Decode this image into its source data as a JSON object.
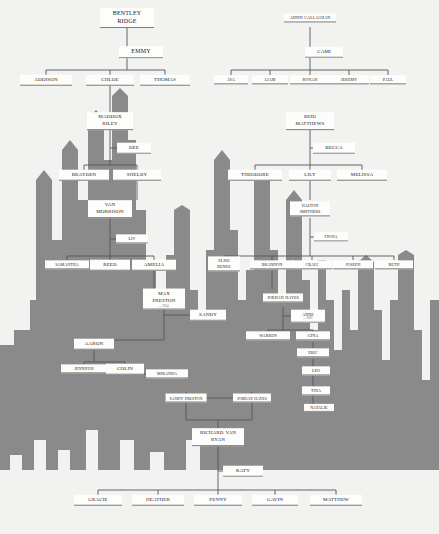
{
  "meta": {
    "background_color": "#f2f2f0",
    "skyline_color": "#8a8a8a",
    "card_color": "#fdfdfb",
    "line_color": "#55555a",
    "text_color": "#1b1b1b"
  },
  "nodes": [
    {
      "id": "bentley-ridge",
      "label": "Bentley Ridge",
      "x": 127,
      "y": 18,
      "size": "s12",
      "two": true,
      "w": 54
    },
    {
      "id": "emmy",
      "label": "Emmy",
      "x": 141,
      "y": 52,
      "size": "s12",
      "two": false,
      "w": 44,
      "spouse": true
    },
    {
      "id": "addison",
      "label": "Addison",
      "x": 46,
      "y": 80,
      "size": "s10",
      "two": false,
      "w": 52
    },
    {
      "id": "chloe",
      "label": "Chloe",
      "x": 110,
      "y": 80,
      "size": "s10",
      "two": false,
      "w": 48
    },
    {
      "id": "thomas",
      "label": "Thomas",
      "x": 165,
      "y": 80,
      "size": "s10",
      "two": false,
      "w": 50
    },
    {
      "id": "aiden-callaghan",
      "label": "Aiden Callaghan",
      "x": 310,
      "y": 18,
      "size": "s8",
      "two": true,
      "w": 52
    },
    {
      "id": "cami",
      "label": "Cami",
      "x": 324,
      "y": 52,
      "size": "s10",
      "two": false,
      "w": 38,
      "spouse": true
    },
    {
      "id": "ava",
      "label": "Ava",
      "x": 231,
      "y": 80,
      "size": "s8",
      "two": false,
      "w": 34
    },
    {
      "id": "liam",
      "label": "Liam",
      "x": 270,
      "y": 80,
      "size": "s8",
      "two": false,
      "w": 36
    },
    {
      "id": "ronan",
      "label": "Ronan",
      "x": 310,
      "y": 80,
      "size": "s8",
      "two": false,
      "w": 40
    },
    {
      "id": "jeremy",
      "label": "Jeremy",
      "x": 349,
      "y": 80,
      "size": "s8",
      "two": false,
      "w": 40
    },
    {
      "id": "paul",
      "label": "Paul",
      "x": 388,
      "y": 80,
      "size": "s8",
      "two": false,
      "w": 36
    },
    {
      "id": "maddox-riley",
      "label": "Maddox Riley",
      "x": 110,
      "y": 121,
      "size": "s10",
      "two": true,
      "w": 46
    },
    {
      "id": "dee",
      "label": "Dee",
      "x": 134,
      "y": 148,
      "size": "s10",
      "two": false,
      "w": 34,
      "spouse": true
    },
    {
      "id": "brayden",
      "label": "Brayden",
      "x": 84,
      "y": 175,
      "size": "s10",
      "two": false,
      "w": 50
    },
    {
      "id": "shelby",
      "label": "Shelby",
      "x": 137,
      "y": 175,
      "size": "s10",
      "two": false,
      "w": 48
    },
    {
      "id": "van-morrison",
      "label": "Van Morrison",
      "x": 110,
      "y": 209,
      "size": "s10",
      "two": true,
      "w": 44
    },
    {
      "id": "liv",
      "label": "Liv",
      "x": 132,
      "y": 239,
      "size": "s8",
      "two": false,
      "w": 32,
      "spouse": true
    },
    {
      "id": "samantha",
      "label": "Samantha",
      "x": 67,
      "y": 265,
      "size": "s8",
      "two": false,
      "w": 44
    },
    {
      "id": "reed",
      "label": "Reed",
      "x": 110,
      "y": 265,
      "size": "s10",
      "two": false,
      "w": 40
    },
    {
      "id": "amelia",
      "label": "Amelia",
      "x": 154,
      "y": 265,
      "size": "s10",
      "two": false,
      "w": 44
    },
    {
      "id": "max-preston",
      "label": "Max Preston",
      "x": 164,
      "y": 299,
      "size": "s10",
      "two": true,
      "w": 42,
      "sub": "b. 1954"
    },
    {
      "id": "sandy",
      "label": "Sandy",
      "x": 208,
      "y": 315,
      "size": "s10",
      "two": false,
      "w": 36,
      "spouse": true
    },
    {
      "id": "aaron",
      "label": "Aaron",
      "x": 94,
      "y": 344,
      "size": "s10",
      "two": false,
      "w": 40
    },
    {
      "id": "jennifer",
      "label": "Jennifer",
      "x": 84,
      "y": 369,
      "size": "s8",
      "two": false,
      "w": 46
    },
    {
      "id": "colin",
      "label": "Colin",
      "x": 125,
      "y": 369,
      "size": "s10",
      "two": false,
      "w": 38
    },
    {
      "id": "miranda",
      "label": "Miranda",
      "x": 167,
      "y": 374,
      "size": "s8",
      "two": false,
      "w": 42,
      "spouse": true
    },
    {
      "id": "reid-matthews",
      "label": "Reid Matthews",
      "x": 310,
      "y": 121,
      "size": "s10",
      "two": true,
      "w": 48
    },
    {
      "id": "becca",
      "label": "Becca",
      "x": 334,
      "y": 148,
      "size": "s10",
      "two": false,
      "w": 42,
      "spouse": true
    },
    {
      "id": "theodore",
      "label": "Theodore",
      "x": 255,
      "y": 175,
      "size": "s10",
      "two": false,
      "w": 54
    },
    {
      "id": "lily",
      "label": "Lily",
      "x": 310,
      "y": 175,
      "size": "s10",
      "two": false,
      "w": 42
    },
    {
      "id": "melissa",
      "label": "Melissa",
      "x": 362,
      "y": 175,
      "size": "s10",
      "two": false,
      "w": 50
    },
    {
      "id": "halton-smithers",
      "label": "Halton Smithers",
      "x": 310,
      "y": 209,
      "size": "s8",
      "two": true,
      "w": 40
    },
    {
      "id": "fiona",
      "label": "Fiona",
      "x": 331,
      "y": 237,
      "size": "s8",
      "two": false,
      "w": 34,
      "spouse": true
    },
    {
      "id": "elise-renee",
      "label": "Elise Renee",
      "x": 224,
      "y": 264,
      "size": "s8",
      "two": true,
      "w": 32
    },
    {
      "id": "brandon",
      "label": "Brandon",
      "x": 272,
      "y": 265,
      "size": "s8",
      "two": false,
      "w": 44
    },
    {
      "id": "craig",
      "label": "Craig",
      "x": 312,
      "y": 265,
      "size": "s8",
      "two": false,
      "w": 40
    },
    {
      "id": "joseph",
      "label": "Joseph",
      "x": 353,
      "y": 265,
      "size": "s8",
      "two": false,
      "w": 40
    },
    {
      "id": "beth",
      "label": "Beth",
      "x": 394,
      "y": 265,
      "size": "s8",
      "two": false,
      "w": 38
    },
    {
      "id": "jordan-hayes-2",
      "label": "Jordan Hayes",
      "x": 283,
      "y": 298,
      "size": "s8",
      "two": true,
      "w": 40
    },
    {
      "id": "anne",
      "label": "Anne",
      "x": 308,
      "y": 316,
      "size": "s8",
      "two": false,
      "w": 34,
      "spouse": true,
      "sub": "b. 1961"
    },
    {
      "id": "warren",
      "label": "Warren",
      "x": 268,
      "y": 336,
      "size": "s8",
      "two": false,
      "w": 44
    },
    {
      "id": "gina",
      "label": "Gina",
      "x": 313,
      "y": 336,
      "size": "s8",
      "two": false,
      "w": 34
    },
    {
      "id": "eric",
      "label": "Eric",
      "x": 313,
      "y": 353,
      "size": "s8",
      "two": false,
      "w": 32
    },
    {
      "id": "leo",
      "label": "Leo",
      "x": 316,
      "y": 371,
      "size": "s8",
      "two": false,
      "w": 28,
      "spouse": true
    },
    {
      "id": "tina",
      "label": "Tina",
      "x": 316,
      "y": 391,
      "size": "s8",
      "two": false,
      "w": 28,
      "spouse": true
    },
    {
      "id": "natalie",
      "label": "Natalie",
      "x": 319,
      "y": 408,
      "size": "s6",
      "two": false,
      "w": 30,
      "spouse": true
    },
    {
      "id": "richard-van-ryan",
      "label": "Richard Van Ryan",
      "x": 218,
      "y": 437,
      "size": "s10",
      "two": true,
      "w": 52
    },
    {
      "id": "katy",
      "label": "Katy",
      "x": 243,
      "y": 471,
      "size": "s10",
      "two": false,
      "w": 40,
      "spouse": true
    },
    {
      "id": "gracie",
      "label": "Gracie",
      "x": 98,
      "y": 500,
      "size": "s10",
      "two": false,
      "w": 48
    },
    {
      "id": "heather",
      "label": "Heather",
      "x": 158,
      "y": 500,
      "size": "s10",
      "two": false,
      "w": 52
    },
    {
      "id": "penny",
      "label": "Penny",
      "x": 218,
      "y": 500,
      "size": "s10",
      "two": false,
      "w": 48
    },
    {
      "id": "gavin",
      "label": "Gavin",
      "x": 275,
      "y": 500,
      "size": "s10",
      "two": false,
      "w": 46
    },
    {
      "id": "matthew",
      "label": "Matthew",
      "x": 336,
      "y": 500,
      "size": "s10",
      "two": false,
      "w": 52
    }
  ],
  "pair_labels": [
    {
      "id": "sandy-preston",
      "label": "Sandy Preston",
      "x": 186,
      "y": 398
    },
    {
      "id": "jordan-hayes-1",
      "label": "Jordan Hayes",
      "x": 252,
      "y": 398
    }
  ],
  "edges": [
    "M127,27 L127,52",
    "M127,52 L127,70",
    "M46,70 L165,70",
    "M46,70 L46,75",
    "M110,70 L110,75",
    "M165,70 L165,75",
    "M127,52 L133,52",
    "M310,27 L310,52",
    "M310,52 L310,70",
    "M231,70 L388,70",
    "M231,70 L231,75",
    "M270,70 L270,75",
    "M310,70 L310,75",
    "M349,70 L349,75",
    "M388,70 L388,75",
    "M310,52 L316,52",
    "M110,86 L110,112",
    "M110,130 L110,148",
    "M110,148 L110,165",
    "M84,165 L137,165",
    "M84,165 L84,170",
    "M137,165 L137,170",
    "M110,148 L126,148",
    "M137,181 L137,200",
    "M110,218 L110,239",
    "M110,239 L110,256",
    "M67,256 L154,256",
    "M67,256 L67,260",
    "M110,256 L110,260",
    "M154,256 L154,260",
    "M110,239 L124,239",
    "M154,271 L154,290",
    "M164,308 L164,315",
    "M164,315 L190,315",
    "M164,315 L164,340",
    "M94,340 L164,340",
    "M94,340 L94,340",
    "M94,350 L94,362",
    "M84,362 L125,362",
    "M84,362 L84,365",
    "M125,362 L125,365",
    "M125,374 L146,374",
    "M310,27 L310,27",
    "M310,130 L310,148",
    "M310,148 L310,165",
    "M255,165 L362,165",
    "M255,165 L255,170",
    "M310,165 L310,170",
    "M362,165 L362,170",
    "M310,148 L323,148",
    "M310,181 L310,200",
    "M310,218 L310,237",
    "M310,237 L320,237",
    "M310,237 L310,256",
    "M224,256 L394,256",
    "M224,256 L224,258",
    "M272,256 L272,260",
    "M312,256 L312,260",
    "M353,256 L353,260",
    "M394,256 L394,260",
    "M272,271 L272,289",
    "M283,307 L283,316",
    "M283,316 L298,316",
    "M283,316 L283,330",
    "M268,330 L313,330",
    "M268,330 L268,332",
    "M313,330 L313,332",
    "M313,342 L313,348",
    "M313,359 L313,408",
    "M313,371 L305,371",
    "M313,391 L305,391",
    "M313,408 L307,408",
    "M186,392 L186,404",
    "M252,392 L252,404",
    "M204,398 L234,398",
    "M186,404 L186,420",
    "M252,404 L252,420",
    "M218,420 L218,428",
    "M186,420 L252,420",
    "M218,446 L218,471",
    "M218,471 L218,490",
    "M98,490 L336,490",
    "M98,490 L98,495",
    "M158,490 L158,495",
    "M218,490 L218,495",
    "M275,490 L275,495",
    "M336,490 L336,495",
    "M218,471 L231,471"
  ],
  "skyline": {
    "description": "grey city skyline silhouette backdrop",
    "path": "M0,534 L0,345 L14,345 L14,330 L30,330 L30,300 L36,300 L36,180 L44,170 L52,180 L52,240 L62,240 L62,150 L70,140 L78,150 L78,200 L88,200 L88,118 L96,110 L104,118 L104,160 L112,160 L112,96 L120,88 L128,96 L128,140 L136,140 L136,210 L146,210 L146,265 L156,265 L156,300 L166,300 L166,255 L174,255 L174,210 L182,205 L190,210 L190,290 L198,290 L198,320 L206,320 L206,250 L214,250 L214,160 L222,150 L230,160 L230,230 L238,230 L238,300 L246,300 L246,270 L254,270 L254,180 L262,175 L270,180 L270,250 L278,250 L278,300 L286,300 L286,200 L294,190 L302,200 L302,280 L310,280 L310,330 L318,330 L318,260 L326,260 L326,300 L334,300 L334,350 L342,350 L342,290 L350,290 L350,330 L358,330 L358,262 L366,255 L374,262 L374,310 L382,310 L382,360 L390,360 L390,300 L398,300 L398,255 L406,250 L414,255 L414,330 L422,330 L422,380 L430,380 L430,300 L439,300 L439,534 Z"
  }
}
